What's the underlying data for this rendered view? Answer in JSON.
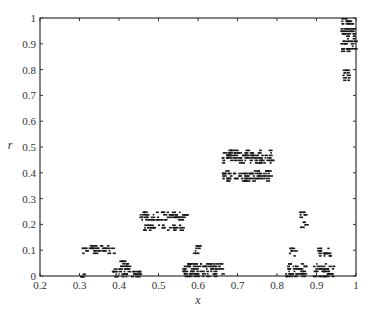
{
  "chart_data": {
    "type": "scatter",
    "title": "",
    "xlabel": "x",
    "ylabel": "r",
    "xlim": [
      0.2,
      1.0
    ],
    "ylim": [
      0,
      1.0
    ],
    "grid": false,
    "legend": null,
    "xticks": [
      0.2,
      0.3,
      0.4,
      0.5,
      0.6,
      0.7,
      0.8,
      0.9,
      1
    ],
    "yticks": [
      0,
      0.1,
      0.2,
      0.3,
      0.4,
      0.5,
      0.6,
      0.7,
      0.8,
      0.9,
      1
    ],
    "xtick_labels": [
      "0.2",
      "0.3",
      "0.4",
      "0.5",
      "0.6",
      "0.7",
      "0.8",
      "0.9",
      "1"
    ],
    "ytick_labels": [
      "0",
      "0.1",
      "0.2",
      "0.3",
      "0.4",
      "0.5",
      "0.6",
      "0.7",
      "0.8",
      "0.9",
      "1"
    ],
    "marker": "short horizontal dashes (dense, fractal-like clusters)",
    "marker_color": "#1a1a1a",
    "series": [
      {
        "name": "points",
        "clusters": [
          {
            "x_range": [
              0.96,
              0.995
            ],
            "r_range": [
              0.87,
              1.0
            ],
            "desc": "top-right cluster"
          },
          {
            "x_range": [
              0.965,
              0.98
            ],
            "r_range": [
              0.76,
              0.81
            ],
            "desc": "sub-cluster below top-right"
          },
          {
            "x_range": [
              0.66,
              0.785
            ],
            "r_range": [
              0.44,
              0.49
            ],
            "desc": "main middle band"
          },
          {
            "x_range": [
              0.66,
              0.78
            ],
            "r_range": [
              0.37,
              0.41
            ],
            "desc": "lower middle band"
          },
          {
            "x_range": [
              0.45,
              0.57
            ],
            "r_range": [
              0.22,
              0.25
            ],
            "desc": "band near 0.24"
          },
          {
            "x_range": [
              0.46,
              0.56
            ],
            "r_range": [
              0.18,
              0.2
            ],
            "desc": "band near 0.19"
          },
          {
            "x_range": [
              0.855,
              0.87
            ],
            "r_range": [
              0.19,
              0.25
            ],
            "desc": "right cluster near 0.22"
          },
          {
            "x_range": [
              0.305,
              0.385
            ],
            "r_range": [
              0.09,
              0.12
            ],
            "desc": "left band near 0.11"
          },
          {
            "x_range": [
              0.4,
              0.43
            ],
            "r_range": [
              0.03,
              0.06
            ],
            "desc": "small cluster near 0.05"
          },
          {
            "x_range": [
              0.585,
              0.6
            ],
            "r_range": [
              0.08,
              0.12
            ],
            "desc": "cluster near 0.1"
          },
          {
            "x_range": [
              0.83,
              0.845
            ],
            "r_range": [
              0.08,
              0.11
            ],
            "desc": "right cluster near 0.1"
          },
          {
            "x_range": [
              0.9,
              0.935
            ],
            "r_range": [
              0.08,
              0.11
            ],
            "desc": "right cluster near 0.1 (b)"
          },
          {
            "x_range": [
              0.3,
              0.31
            ],
            "r_range": [
              0.0,
              0.01
            ],
            "desc": "bottom near 0.3"
          },
          {
            "x_range": [
              0.38,
              0.45
            ],
            "r_range": [
              0.0,
              0.03
            ],
            "desc": "bottom near 0.4"
          },
          {
            "x_range": [
              0.56,
              0.66
            ],
            "r_range": [
              0.0,
              0.05
            ],
            "desc": "bottom near 0.6"
          },
          {
            "x_range": [
              0.82,
              0.87
            ],
            "r_range": [
              0.0,
              0.05
            ],
            "desc": "bottom near 0.85"
          },
          {
            "x_range": [
              0.89,
              0.94
            ],
            "r_range": [
              0.0,
              0.05
            ],
            "desc": "bottom near 0.92"
          }
        ]
      }
    ]
  }
}
